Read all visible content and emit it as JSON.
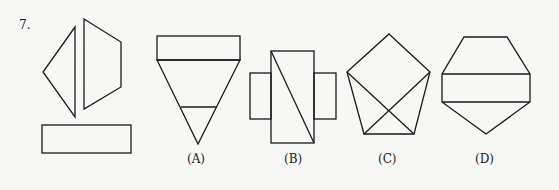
{
  "question": {
    "number": "7.",
    "pieces": [
      "triangle",
      "quadrilateral",
      "rectangle"
    ]
  },
  "options": [
    {
      "label": "(A)",
      "description": "inverted triangle with rectangle on top and a horizontal cut line"
    },
    {
      "label": "(B)",
      "description": "cross shape with diagonal in central rectangle"
    },
    {
      "label": "(C)",
      "description": "pentagon with two crossing diagonals from upper side vertices"
    },
    {
      "label": "(D)",
      "description": "hexagonal shape with central rectangle band"
    }
  ],
  "colors": {
    "background": "#f7f7f5",
    "stroke": "#1a1a1a"
  }
}
